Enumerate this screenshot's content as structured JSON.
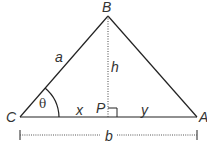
{
  "diagram": {
    "type": "triangle-with-altitude",
    "vertices": {
      "B": {
        "label": "B"
      },
      "C": {
        "label": "C"
      },
      "A": {
        "label": "A"
      },
      "P": {
        "label": "P"
      }
    },
    "sides": {
      "a": "a",
      "h": "h",
      "x": "x",
      "y": "y",
      "b": "b"
    },
    "angle": "θ",
    "colors": {
      "stroke": "#222222",
      "text": "#333333"
    }
  }
}
